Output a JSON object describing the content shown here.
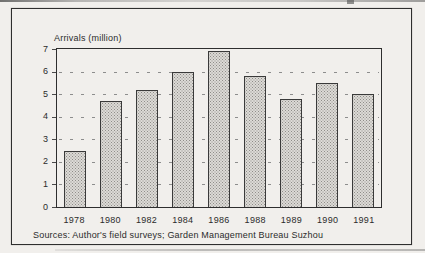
{
  "figure": {
    "axis_title": "Arrivals (million)",
    "source_note": "Sources: Author's field surveys; Garden Management Bureau Suzhou"
  },
  "chart_data": {
    "type": "bar",
    "title": "Arrivals (million)",
    "categories": [
      "1978",
      "1980",
      "1982",
      "1984",
      "1986",
      "1988",
      "1989",
      "1990",
      "1991"
    ],
    "values": [
      2.5,
      4.7,
      5.2,
      6.0,
      6.9,
      5.8,
      4.8,
      5.5,
      5.0
    ],
    "xlabel": "",
    "ylabel": "Arrivals (million)",
    "ylim": [
      0,
      7
    ],
    "yticks": [
      0,
      1,
      2,
      3,
      4,
      5,
      6,
      7
    ],
    "grid": "horizontal-dashed",
    "legend": "none",
    "bar_style": "halftone-gray-screen"
  },
  "colors": {
    "page_background": "#f1efec",
    "frame": "#2e2e2e",
    "bar_fill_base": "#dcdad6",
    "bar_halftone_dot": "#8f8d89",
    "bar_border": "#3a3a3a",
    "gridline": "#8d8d8d",
    "text": "#2b2b2b"
  }
}
